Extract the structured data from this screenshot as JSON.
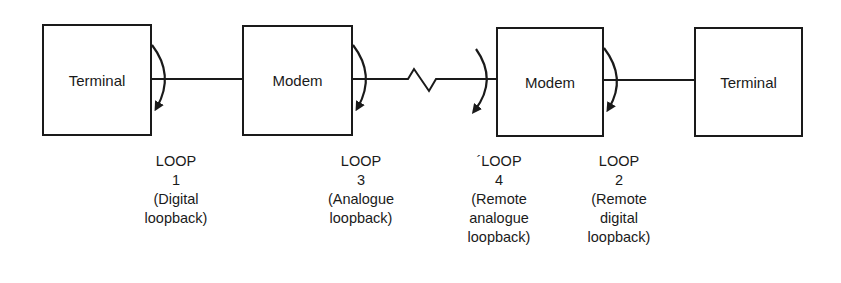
{
  "nodes": [
    {
      "id": "terminal-left",
      "label": "Terminal"
    },
    {
      "id": "modem-left",
      "label": "Modem"
    },
    {
      "id": "modem-right",
      "label": "Modem"
    },
    {
      "id": "terminal-right",
      "label": "Terminal"
    }
  ],
  "loops": [
    {
      "title": "LOOP",
      "number": "1",
      "desc1": "(Digital",
      "desc2": "loopback)",
      "desc3": ""
    },
    {
      "title": "LOOP",
      "number": "3",
      "desc1": "(Analogue",
      "desc2": "loopback)",
      "desc3": ""
    },
    {
      "title": "´LOOP",
      "number": "4",
      "desc1": "(Remote",
      "desc2": "analogue",
      "desc3": "loopback)"
    },
    {
      "title": "LOOP",
      "number": "2",
      "desc1": "(Remote",
      "desc2": "digital",
      "desc3": "loopback)"
    }
  ],
  "colors": {
    "line": "#1a1a1a",
    "background": "#ffffff"
  }
}
